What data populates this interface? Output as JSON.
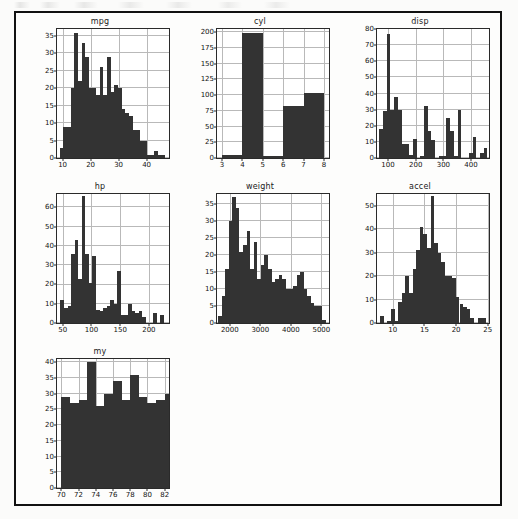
{
  "page": {
    "background_color": "#fbfbfa",
    "frame_color": "#111111",
    "bar_color": "#333333",
    "grid_color": "#b9b9b9",
    "axis_color": "#2a2a2a"
  },
  "figure": {
    "layout": "3x3 grid of histogram subplots",
    "n_plots": 7
  },
  "chart_data": [
    {
      "type": "bar",
      "title": "mpg",
      "xlabel": "",
      "ylabel": "",
      "grid": true,
      "legend": null,
      "xlim": [
        8,
        48
      ],
      "ylim": [
        0,
        37
      ],
      "xticks": [
        10,
        20,
        30,
        40
      ],
      "yticks": [
        0,
        5,
        10,
        15,
        20,
        25,
        30,
        35
      ],
      "bin_edges": [
        9,
        10.3,
        11.6,
        12.9,
        14.2,
        15.5,
        16.8,
        18.1,
        19.4,
        20.7,
        22,
        23.3,
        24.6,
        25.9,
        27.2,
        28.5,
        29.8,
        31.1,
        32.4,
        33.7,
        35,
        36.3,
        37.6,
        38.9,
        40.2,
        41.5,
        42.8,
        44.1,
        45.4,
        46.7
      ],
      "values": [
        3,
        9,
        9,
        20,
        36,
        22,
        33,
        29,
        20,
        20,
        18,
        26,
        18,
        29,
        19,
        21,
        20,
        14,
        13,
        12,
        8,
        8,
        5,
        5,
        1,
        1,
        2,
        1,
        1
      ]
    },
    {
      "type": "bar",
      "title": "cyl",
      "xlabel": "",
      "ylabel": "",
      "grid": true,
      "legend": null,
      "xlim": [
        2.75,
        8.25
      ],
      "ylim": [
        0,
        205
      ],
      "xticks": [
        3,
        4,
        5,
        6,
        7,
        8
      ],
      "yticks": [
        0,
        25,
        50,
        75,
        100,
        125,
        150,
        175,
        200
      ],
      "bin_edges": [
        3,
        4,
        5,
        6,
        7,
        8
      ],
      "values": [
        4,
        199,
        3,
        83,
        103
      ]
    },
    {
      "type": "bar",
      "title": "disp",
      "xlabel": "",
      "ylabel": "",
      "grid": true,
      "legend": null,
      "xlim": [
        60,
        465
      ],
      "ylim": [
        0,
        80
      ],
      "xticks": [
        100,
        200,
        300,
        400
      ],
      "yticks": [
        0,
        10,
        20,
        30,
        40,
        50,
        60,
        70,
        80
      ],
      "bin_edges": [
        68,
        81.5,
        95,
        108.5,
        122,
        135.5,
        149,
        162.5,
        176,
        189.5,
        203,
        216.5,
        230,
        243.5,
        257,
        270.5,
        284,
        297.5,
        311,
        324.5,
        338,
        351.5,
        365,
        378.5,
        392,
        405.5,
        419,
        432.5,
        446,
        459.5
      ],
      "values": [
        18,
        29,
        77,
        30,
        38,
        30,
        9,
        9,
        2,
        12,
        0,
        1,
        32,
        17,
        11,
        0,
        1,
        1,
        25,
        17,
        1,
        30,
        0,
        0,
        3,
        13,
        0,
        3,
        6
      ]
    },
    {
      "type": "bar",
      "title": "hp",
      "xlabel": "",
      "ylabel": "",
      "grid": true,
      "legend": null,
      "xlim": [
        40,
        235
      ],
      "ylim": [
        0,
        67
      ],
      "xticks": [
        50,
        100,
        150,
        200
      ],
      "yticks": [
        0,
        10,
        20,
        30,
        40,
        50,
        60
      ],
      "bin_edges": [
        46,
        52.2,
        58.4,
        64.6,
        70.8,
        77,
        83.2,
        89.4,
        95.6,
        101.8,
        108,
        114.2,
        120.4,
        126.6,
        132.8,
        139,
        145.2,
        151.4,
        157.6,
        163.8,
        170,
        176.2,
        182.4,
        188.6,
        194.8,
        201,
        207.2,
        213.4,
        219.6,
        225.8
      ],
      "values": [
        12,
        8,
        9,
        36,
        43,
        23,
        66,
        36,
        21,
        35,
        7,
        6,
        8,
        9,
        12,
        10,
        27,
        4,
        4,
        10,
        6,
        5,
        6,
        3,
        0,
        0,
        5,
        0,
        4
      ]
    },
    {
      "type": "bar",
      "title": "weight",
      "xlabel": "",
      "ylabel": "",
      "grid": true,
      "legend": null,
      "xlim": [
        1580,
        5250
      ],
      "ylim": [
        0,
        38
      ],
      "xticks": [
        2000,
        3000,
        4000,
        5000
      ],
      "yticks": [
        0,
        5,
        10,
        15,
        20,
        25,
        30,
        35
      ],
      "bin_edges": [
        1613,
        1730,
        1847,
        1964,
        2081,
        2198,
        2315,
        2432,
        2549,
        2666,
        2783,
        2900,
        3017,
        3134,
        3251,
        3368,
        3485,
        3602,
        3719,
        3836,
        3953,
        4070,
        4187,
        4304,
        4421,
        4538,
        4655,
        4772,
        4889,
        5006,
        5140
      ],
      "values": [
        2,
        8,
        16,
        30,
        37,
        34,
        21,
        23,
        27,
        16,
        24,
        13,
        17,
        20,
        16,
        12,
        13,
        14,
        13,
        10,
        10,
        11,
        14,
        15,
        10,
        8,
        6,
        5,
        5,
        1
      ]
    },
    {
      "type": "bar",
      "title": "accel",
      "xlabel": "",
      "ylabel": "",
      "grid": true,
      "legend": null,
      "xlim": [
        7.5,
        25.2
      ],
      "ylim": [
        0,
        55
      ],
      "xticks": [
        10,
        15,
        20,
        25
      ],
      "yticks": [
        0,
        10,
        20,
        30,
        40,
        50
      ],
      "bin_edges": [
        8,
        8.57,
        9.14,
        9.71,
        10.28,
        10.85,
        11.42,
        11.99,
        12.56,
        13.13,
        13.7,
        14.27,
        14.84,
        15.41,
        15.98,
        16.55,
        17.12,
        17.69,
        18.26,
        18.83,
        19.4,
        19.97,
        20.54,
        21.11,
        21.68,
        22.25,
        22.82,
        23.39,
        23.96,
        24.8
      ],
      "values": [
        3,
        0,
        1,
        6,
        1,
        9,
        13,
        20,
        13,
        23,
        31,
        41,
        38,
        32,
        54,
        34,
        30,
        26,
        20,
        20,
        19,
        11,
        8,
        7,
        6,
        2,
        0,
        2,
        2
      ]
    },
    {
      "type": "bar",
      "title": "my",
      "xlabel": "",
      "ylabel": "",
      "grid": true,
      "legend": null,
      "xlim": [
        69.5,
        82.5
      ],
      "ylim": [
        0,
        41
      ],
      "xticks": [
        70,
        72,
        74,
        76,
        78,
        80,
        82
      ],
      "yticks": [
        0,
        5,
        10,
        15,
        20,
        25,
        30,
        35,
        40
      ],
      "bin_edges": [
        70,
        71,
        72,
        73,
        74,
        75,
        76,
        77,
        78,
        79,
        80,
        81,
        82,
        82.9
      ],
      "values": [
        29,
        27,
        28,
        40,
        26,
        30,
        34,
        28,
        36,
        29,
        27,
        28,
        30
      ]
    }
  ]
}
